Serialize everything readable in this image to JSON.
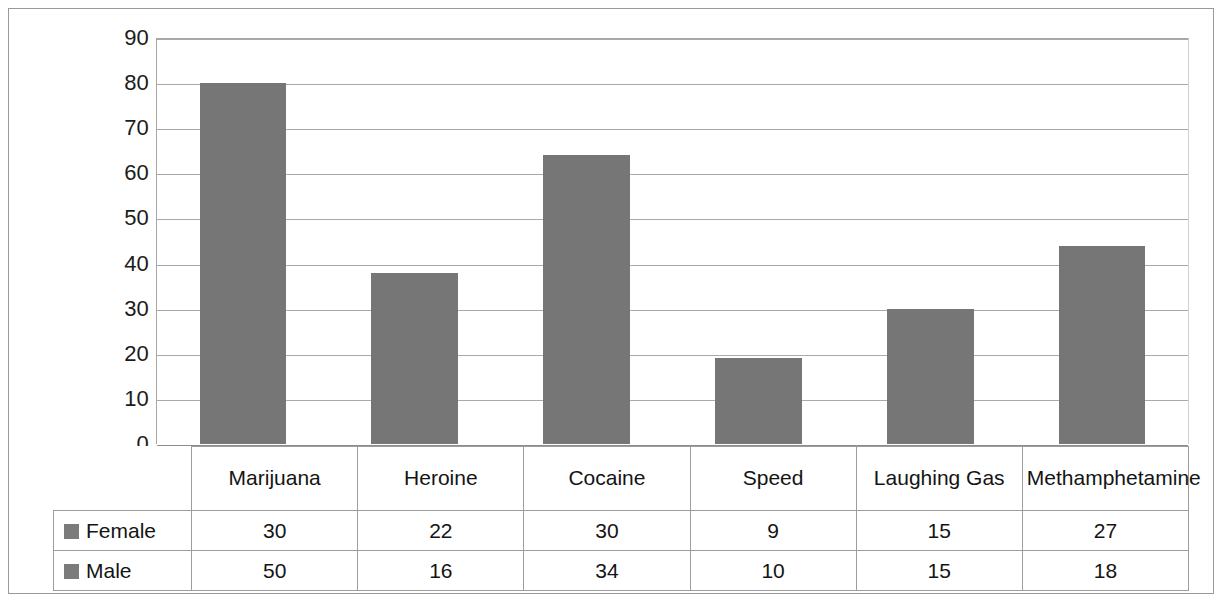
{
  "chart_data": {
    "type": "bar",
    "title": "",
    "subtitle": "",
    "xlabel": "",
    "ylabel": "",
    "categories": [
      "Marijuana",
      "Heroine",
      "Cocaine",
      "Speed",
      "Laughing Gas",
      "Methamphetamine"
    ],
    "values": [
      80,
      38,
      64,
      19,
      30,
      44
    ],
    "ylim": [
      0,
      90
    ],
    "ytick_step": 10,
    "yticks": [
      "90",
      "80",
      "70",
      "60",
      "50",
      "40",
      "30",
      "20",
      "10",
      "0"
    ],
    "grid": true,
    "legend_position": "table-left",
    "bar_color": "#767676",
    "gridline_color": "#a9a9a9",
    "series": [
      {
        "name": "Female",
        "values": [
          30,
          22,
          30,
          9,
          15,
          27
        ]
      },
      {
        "name": "Male",
        "values": [
          50,
          16,
          34,
          10,
          15,
          18
        ]
      }
    ],
    "note": "Plotted bars show the total of Female + Male for each category."
  },
  "table": {
    "header": {
      "corner": "",
      "categories": [
        "Marijuana",
        "Heroine",
        "Cocaine",
        "Speed",
        "Laughing Gas",
        "Methamphetamine"
      ]
    },
    "rows": [
      {
        "label": "Female",
        "swatch_color": "#7b7b7b",
        "values": [
          "30",
          "22",
          "30",
          "9",
          "15",
          "27"
        ]
      },
      {
        "label": "Male",
        "swatch_color": "#7b7b7b",
        "values": [
          "50",
          "16",
          "34",
          "10",
          "15",
          "18"
        ]
      }
    ]
  }
}
